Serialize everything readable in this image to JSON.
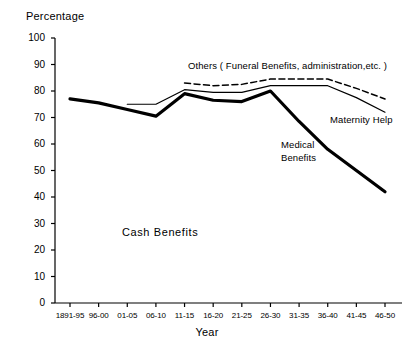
{
  "chart_data": {
    "type": "line",
    "title": "",
    "xlabel": "Year",
    "ylabel": "Percentage",
    "ylim": [
      0,
      100
    ],
    "ytick_step": 10,
    "grid": false,
    "legend_position": "inline-annotations",
    "categories": [
      "1891-95",
      "96-00",
      "01-05",
      "06-10",
      "11-15",
      "16-20",
      "21-25",
      "26-30",
      "31-35",
      "36-40",
      "41-45",
      "46-50"
    ],
    "yticks": [
      "0",
      "10",
      "20",
      "30",
      "40",
      "50",
      "60",
      "70",
      "80",
      "90",
      "100"
    ],
    "series": [
      {
        "name": "Cash Benefits",
        "style": "thick-solid",
        "color": "#000000",
        "values": [
          77,
          75.5,
          73,
          70.5,
          79,
          76.5,
          76,
          80,
          68.5,
          58,
          50,
          42
        ]
      },
      {
        "name": "Maternity Help",
        "style": "thin-solid",
        "color": "#000000",
        "values": [
          null,
          null,
          75,
          75,
          80.5,
          79.5,
          79.5,
          82,
          82,
          82,
          77.5,
          72
        ]
      },
      {
        "name": "Others ( Funeral Benefits, administration, etc. )",
        "style": "dashed",
        "color": "#000000",
        "values": [
          null,
          null,
          null,
          null,
          83,
          82,
          82.5,
          84.5,
          84.5,
          84.5,
          81,
          77
        ]
      }
    ],
    "annotations": [
      {
        "text": "Others ( Funeral Benefits, administration,etc. )",
        "series": "Others ( Funeral Benefits, administration, etc. )"
      },
      {
        "text": "Maternity Help",
        "series": "Maternity Help"
      },
      {
        "text": "Medical\nBenefits",
        "series": "Medical Benefits"
      },
      {
        "text": "Cash Benefits",
        "series": "Cash Benefits"
      }
    ]
  },
  "labels": {
    "ylabel_title": "Percentage",
    "xlabel_title": "Year",
    "others": "Others ( Funeral Benefits, administration,etc. )",
    "maternity": "Maternity Help",
    "medical_line1": "Medical",
    "medical_line2": "Benefits",
    "cash": "Cash Benefits"
  },
  "colors": {
    "background": "#ffffff",
    "ink": "#000000"
  }
}
